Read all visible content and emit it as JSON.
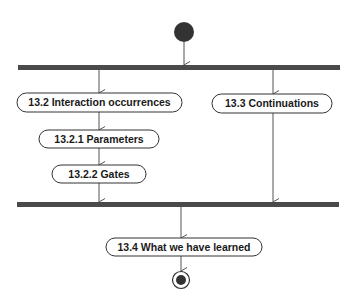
{
  "diagram": {
    "type": "UML activity diagram",
    "colors": {
      "bar": "#4a4a4a",
      "node_fill": "#ffffff",
      "node_stroke": "#333333",
      "edge": "#555555",
      "start": "#333333"
    },
    "nodes": [
      {
        "id": "n1",
        "label": "13.2 Interaction occurrences"
      },
      {
        "id": "n2",
        "label": "13.2.1 Parameters"
      },
      {
        "id": "n3",
        "label": "13.2.2 Gates"
      },
      {
        "id": "n4",
        "label": "13.3 Continuations"
      },
      {
        "id": "n5",
        "label": "13.4 What we have learned"
      }
    ],
    "start": {
      "label": "initial node"
    },
    "end": {
      "label": "final node"
    },
    "fork": {
      "label": "fork bar"
    },
    "join": {
      "label": "join bar"
    },
    "edges": [
      [
        "start",
        "fork"
      ],
      [
        "fork",
        "n1"
      ],
      [
        "fork",
        "n4"
      ],
      [
        "n1",
        "n2"
      ],
      [
        "n2",
        "n3"
      ],
      [
        "n3",
        "join"
      ],
      [
        "n4",
        "join"
      ],
      [
        "join",
        "n5"
      ],
      [
        "n5",
        "end"
      ]
    ]
  }
}
